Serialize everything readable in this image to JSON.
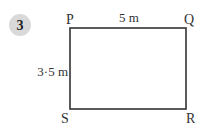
{
  "question": {
    "number": "3",
    "badge_color": "#d9d9d9"
  },
  "shape": {
    "type": "rectangle",
    "vertices": {
      "top_left": "P",
      "top_right": "Q",
      "bottom_right": "R",
      "bottom_left": "S"
    },
    "dimensions": {
      "top": "5 m",
      "left": "3·5 m"
    },
    "stroke_color": "#333333"
  }
}
